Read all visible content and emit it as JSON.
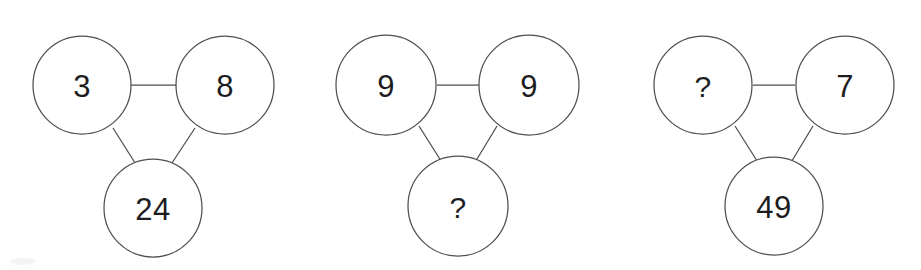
{
  "canvas": {
    "width": 921,
    "height": 270,
    "background": "#ffffff",
    "stroke_color": "#4f4f52",
    "text_color": "#1d1d1f"
  },
  "puzzle": {
    "title": "Number triangle puzzle",
    "query_symbol": "?",
    "groups": [
      {
        "id": "group-1",
        "nodes": {
          "top_left": "3",
          "top_right": "8",
          "bottom": "24"
        }
      },
      {
        "id": "group-2",
        "nodes": {
          "top_left": "9",
          "top_right": "9",
          "bottom": "?"
        }
      },
      {
        "id": "group-3",
        "nodes": {
          "top_left": "?",
          "top_right": "7",
          "bottom": "49"
        }
      }
    ]
  }
}
